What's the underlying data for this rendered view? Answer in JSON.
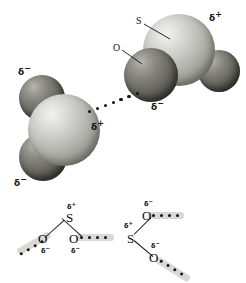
{
  "figure": {
    "background_color": "#ffffff",
    "sulfur_color": "#c9c9c4",
    "oxygen_color": "#6d6d66",
    "ink_color": "#111111",
    "highlight_band_color": "#d8d8d6"
  },
  "symbols": {
    "sulfur": "S",
    "oxygen": "O",
    "delta_plus": "δ",
    "delta_plus_sign": "+",
    "delta_minus": "δ",
    "delta_minus_sign": "−"
  },
  "top_model": {
    "description": "Two space-filling SO2 models joined by a dotted dipole-dipole attraction",
    "right_molecule": {
      "name": "sulfur-dioxide-molecule-right",
      "sulfur_label": "S",
      "sulfur_charge_delta": "δ",
      "sulfur_charge_sign": "+",
      "oxygen_label": "O",
      "oxygen_charge_delta": "δ",
      "oxygen_charge_sign": "−"
    },
    "left_molecule": {
      "name": "sulfur-dioxide-molecule-left",
      "sulfur_charge_delta": "δ",
      "sulfur_charge_sign": "+",
      "oxygen_top_charge_delta": "δ",
      "oxygen_top_charge_sign": "−",
      "oxygen_bottom_charge_delta": "δ",
      "oxygen_bottom_charge_sign": "−"
    },
    "attraction": {
      "name": "dipole-dipole-dotted-line",
      "dot_count": 9,
      "style": "dotted"
    }
  },
  "bottom_formula": {
    "description": "Structural chain of SO2 units linked by dotted dipole attractions",
    "atoms": [
      {
        "id": "o-left-lower",
        "symbol": "O",
        "charge_delta": "δ",
        "charge_sign": "−"
      },
      {
        "id": "s-left",
        "symbol": "S",
        "charge_delta": "δ",
        "charge_sign": "+"
      },
      {
        "id": "o-center",
        "symbol": "O",
        "charge_delta": "δ",
        "charge_sign": "−"
      },
      {
        "id": "s-right",
        "symbol": "S",
        "charge_delta": "δ",
        "charge_sign": "+"
      },
      {
        "id": "o-right-upper",
        "symbol": "O",
        "charge_delta": "δ",
        "charge_sign": "−"
      },
      {
        "id": "o-right-lower",
        "symbol": "O",
        "charge_delta": "δ",
        "charge_sign": "−"
      }
    ],
    "dotted_links": [
      {
        "id": "dots-far-left",
        "dot_count": 4
      },
      {
        "id": "dots-center",
        "dot_count": 4
      },
      {
        "id": "dots-upper-right",
        "dot_count": 4
      },
      {
        "id": "dots-lower-right",
        "dot_count": 4
      }
    ]
  }
}
